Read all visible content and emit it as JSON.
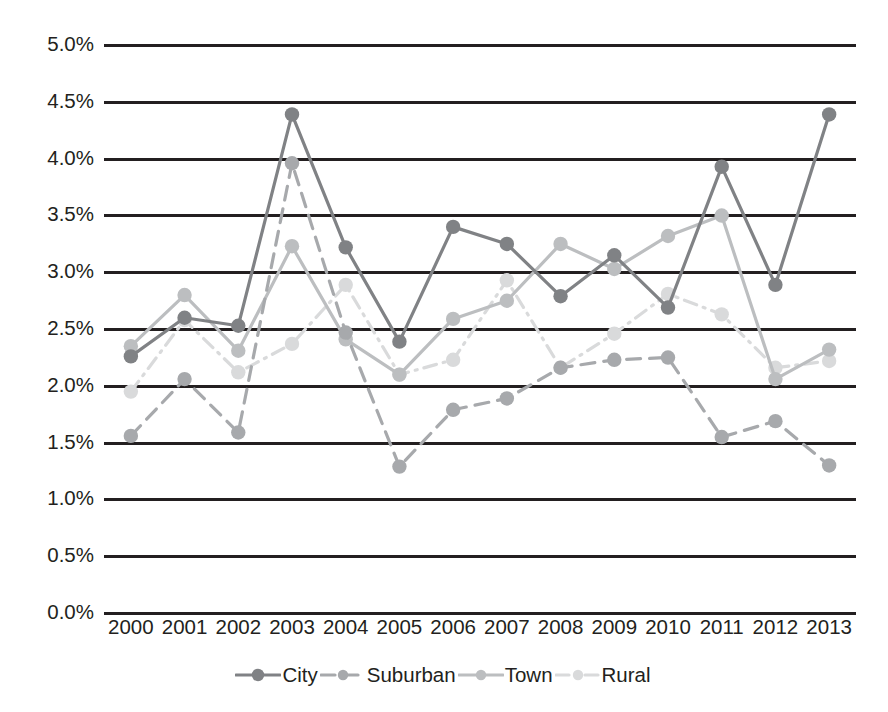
{
  "chart_data": {
    "type": "line",
    "title": "",
    "subtitle": "",
    "xlabel": "",
    "ylabel": "",
    "categories": [
      "2000",
      "2001",
      "2002",
      "2003",
      "2004",
      "2005",
      "2006",
      "2007",
      "2008",
      "2009",
      "2010",
      "2011",
      "2012",
      "2013"
    ],
    "ylim": [
      0.0,
      5.0
    ],
    "ytick_values": [
      0.0,
      0.5,
      1.0,
      1.5,
      2.0,
      2.5,
      3.0,
      3.5,
      4.0,
      4.5,
      5.0
    ],
    "ytick_labels": [
      "0.0%",
      "0.5%",
      "1.0%",
      "1.5%",
      "2.0%",
      "2.5%",
      "3.0%",
      "3.5%",
      "4.0%",
      "4.5%",
      "5.0%"
    ],
    "grid": true,
    "legend_position": "bottom",
    "value_suffix": "%",
    "series": [
      {
        "name": "City",
        "color": "#808285",
        "line_style": "solid",
        "marker": "circle",
        "values": [
          2.25,
          2.59,
          2.52,
          4.38,
          3.21,
          2.38,
          3.39,
          3.24,
          2.78,
          3.14,
          2.68,
          3.92,
          2.88,
          4.38
        ]
      },
      {
        "name": "Suburban",
        "color": "#a7a9ac",
        "line_style": "dashed",
        "marker": "circle",
        "values": [
          1.55,
          2.05,
          1.58,
          3.95,
          2.46,
          1.28,
          1.78,
          1.88,
          2.15,
          2.22,
          2.24,
          1.54,
          1.68,
          1.29
        ]
      },
      {
        "name": "Town",
        "color": "#bcbec0",
        "line_style": "solid",
        "marker": "circle",
        "values": [
          2.34,
          2.79,
          2.3,
          3.22,
          2.4,
          2.09,
          2.58,
          2.74,
          3.24,
          3.02,
          3.31,
          3.49,
          2.05,
          2.31
        ]
      },
      {
        "name": "Rural",
        "color": "#d9dadb",
        "line_style": "dashdot",
        "marker": "circle",
        "values": [
          1.94,
          2.57,
          2.11,
          2.36,
          2.88,
          2.09,
          2.22,
          2.92,
          2.15,
          2.45,
          2.8,
          2.62,
          2.15,
          2.21
        ]
      }
    ]
  },
  "legend": {
    "items": [
      {
        "label": "City"
      },
      {
        "label": "Suburban"
      },
      {
        "label": "Town"
      },
      {
        "label": "Rural"
      }
    ]
  }
}
